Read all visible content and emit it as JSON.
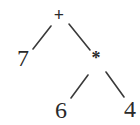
{
  "diagram": {
    "type": "expression-tree",
    "edge_color": "#3a3a3a",
    "nodes": [
      {
        "id": "root",
        "label": "+",
        "x": 59,
        "y": 15,
        "kind": "op"
      },
      {
        "id": "left",
        "label": "7",
        "x": 23,
        "y": 58,
        "kind": "num"
      },
      {
        "id": "mul",
        "label": "*",
        "x": 96,
        "y": 58,
        "kind": "op"
      },
      {
        "id": "mul-left",
        "label": "6",
        "x": 61,
        "y": 110,
        "kind": "num"
      },
      {
        "id": "mul-right",
        "label": "4",
        "x": 130,
        "y": 109,
        "kind": "num"
      }
    ],
    "edges": [
      {
        "from": "root",
        "to": "left",
        "x1": 51,
        "y1": 26,
        "x2": 33,
        "y2": 49
      },
      {
        "from": "root",
        "to": "mul",
        "x1": 69,
        "y1": 24,
        "x2": 90,
        "y2": 50
      },
      {
        "from": "mul",
        "to": "mul-left",
        "x1": 88,
        "y1": 75,
        "x2": 71,
        "y2": 98
      },
      {
        "from": "mul",
        "to": "mul-right",
        "x1": 106,
        "y1": 72,
        "x2": 124,
        "y2": 97
      }
    ]
  }
}
